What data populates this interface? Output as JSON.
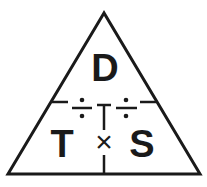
{
  "diagram": {
    "top_label": "D",
    "bottom_left_label": "T",
    "bottom_right_label": "S",
    "multiply_symbol": "×",
    "divide_symbols": [
      "÷",
      "÷"
    ],
    "line_color": "#1a1a1a",
    "background": "#ffffff"
  }
}
